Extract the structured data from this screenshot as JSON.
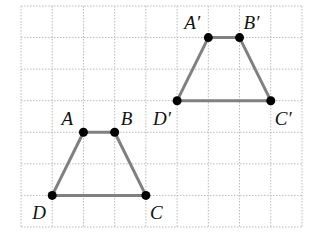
{
  "diagram": {
    "type": "grid-translation",
    "grid": {
      "origin_px": [
        21,
        6
      ],
      "cell_px": [
        31.22,
        31.57
      ],
      "cols": 9,
      "rows": 7,
      "line_color": "#bbbbbb",
      "line_style": "dotted"
    },
    "style": {
      "edge_color": "#808080",
      "edge_width": 3,
      "point_color": "#000000",
      "point_radius": 4.5
    },
    "shapes": [
      {
        "name": "trapezoid-abcd",
        "vertices": [
          {
            "label": "A",
            "grid": [
              2,
              4
            ],
            "label_offset": [
              -22,
              -23
            ]
          },
          {
            "label": "B",
            "grid": [
              3,
              4
            ],
            "label_offset": [
              6,
              -23
            ]
          },
          {
            "label": "C",
            "grid": [
              4,
              6
            ],
            "label_offset": [
              4,
              8
            ]
          },
          {
            "label": "D",
            "grid": [
              1,
              6
            ],
            "label_offset": [
              -20,
              8
            ]
          }
        ]
      },
      {
        "name": "trapezoid-a-prime-b-prime-c-prime-d-prime",
        "vertices": [
          {
            "label": "A′",
            "grid": [
              6,
              1
            ],
            "label_offset": [
              -24,
              -25
            ]
          },
          {
            "label": "B′",
            "grid": [
              7,
              1
            ],
            "label_offset": [
              4,
              -25
            ]
          },
          {
            "label": "C′",
            "grid": [
              8,
              3
            ],
            "label_offset": [
              4,
              8
            ]
          },
          {
            "label": "D′",
            "grid": [
              5,
              3
            ],
            "label_offset": [
              -24,
              8
            ]
          }
        ]
      }
    ]
  }
}
